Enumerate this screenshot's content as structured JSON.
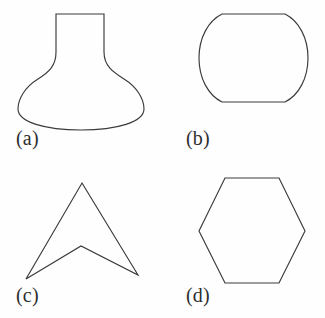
{
  "figure": {
    "background_color": "#fefefe",
    "stroke_color": "#3a3a3a",
    "label_color": "#2e2e2e",
    "panels": [
      {
        "id": "a",
        "label": "(a)",
        "shape_name": "vase-outline",
        "description": "Vase / flask outline with straight neck and bulbous rounded body",
        "path": "M 56 14 L 104 14 L 104 52 C 104 66 113 72 124 79 C 137 87 144 99 144 109 C 144 122 117 130 81 130 C 45 130 18 122 18 109 C 18 99 25 87 38 79 C 49 72 56 66 56 52 Z"
      },
      {
        "id": "b",
        "label": "(b)",
        "shape_name": "flat-topped-circle-outline",
        "description": "Circle-like closed curve with flat top edge and flat bottom edge",
        "path": "M 59 14 L 122 14 C 136 21 145 38 145 58 C 145 78 136 95 122 102 L 59 102 C 45 95 36 78 36 58 C 36 38 45 21 59 14 Z"
      },
      {
        "id": "c",
        "label": "(c)",
        "shape_name": "concave-arrowhead-outline",
        "description": "Non-convex arrowhead / chevron with four vertices and a notch at the bottom",
        "path": "M 82 24 L 138 116 L 81 87 L 26 120 Z"
      },
      {
        "id": "d",
        "label": "(d)",
        "shape_name": "hexagon-outline",
        "description": "Regular hexagon with flat top and bottom edges",
        "path": "M 62 19 L 116 19 L 142 72 L 116 124 L 62 124 L 36 72 Z"
      }
    ]
  }
}
